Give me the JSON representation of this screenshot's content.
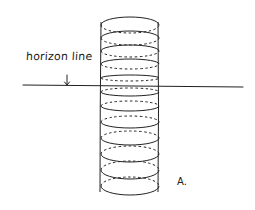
{
  "diagram": {
    "labels": {
      "horizon": "horizon line",
      "figure": "A."
    },
    "colors": {
      "ink": "#222222",
      "background": "#ffffff"
    },
    "horizon": {
      "y": 86,
      "x_start": 23,
      "x_end": 243
    },
    "arrow": {
      "x": 67,
      "y_top": 75,
      "y_bottom": 85
    },
    "column": {
      "left_x": 101,
      "right_x": 158,
      "top_y": 22,
      "bottom_y": 192,
      "ellipse_center_x": 130,
      "ellipse_half_width": 29,
      "ellipse_centers_y": [
        25,
        38,
        51,
        64,
        78,
        92,
        106,
        122,
        138,
        154,
        170,
        186
      ],
      "ellipse_half_heights": [
        8,
        7,
        6,
        5,
        3,
        4,
        5,
        6,
        7,
        8,
        9,
        9
      ]
    }
  }
}
